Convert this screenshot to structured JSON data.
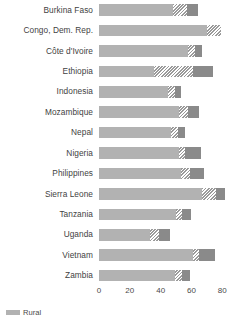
{
  "chart_data": {
    "type": "bar",
    "title": "",
    "subtitle": "",
    "xlabel": "",
    "ylabel": "",
    "orientation": "horizontal",
    "stacked": true,
    "grid": false,
    "xlim": [
      0,
      85
    ],
    "xticks": [
      0,
      20,
      40,
      60,
      80
    ],
    "xtick_labels": [
      "0",
      "20",
      "40",
      "60",
      "80"
    ],
    "legend_position": "bottom-left",
    "categories": [
      "Burkina Faso",
      "Congo, Dem. Rep.",
      "Côte d'Ivoire",
      "Ethiopia",
      "Indonesia",
      "Mozambique",
      "Nepal",
      "Nigeria",
      "Philippines",
      "Sierra Leone",
      "Tanzania",
      "Uganda",
      "Vietnam",
      "Zambia"
    ],
    "series": [
      {
        "name": "segment-1",
        "color": "#b2b2b2",
        "values": [
          48,
          70,
          58,
          36,
          45,
          52,
          47,
          52,
          53,
          67,
          50,
          33,
          61,
          49
        ]
      },
      {
        "name": "segment-2",
        "color": "#d6d6d6",
        "pattern": "diagonal-hatch",
        "values": [
          9,
          9,
          4,
          25,
          4,
          6,
          4,
          4,
          6,
          9,
          4,
          6,
          4,
          5
        ]
      },
      {
        "name": "segment-3",
        "color": "#8a8a8a",
        "values": [
          7,
          0,
          5,
          13,
          4,
          7,
          5,
          10,
          9,
          6,
          6,
          7,
          10,
          5
        ]
      }
    ],
    "totals": [
      64,
      79,
      67,
      74,
      53,
      65,
      56,
      66,
      68,
      82,
      60,
      46,
      75,
      59
    ]
  },
  "legend": {
    "items": [
      {
        "label": "Rural",
        "swatch": "sw-a"
      }
    ]
  },
  "colors": {
    "segment_light": "#b2b2b2",
    "segment_hatch": "#d6d6d6",
    "segment_dark": "#8a8a8a",
    "text": "#3f3f3f",
    "background": "#ffffff"
  }
}
